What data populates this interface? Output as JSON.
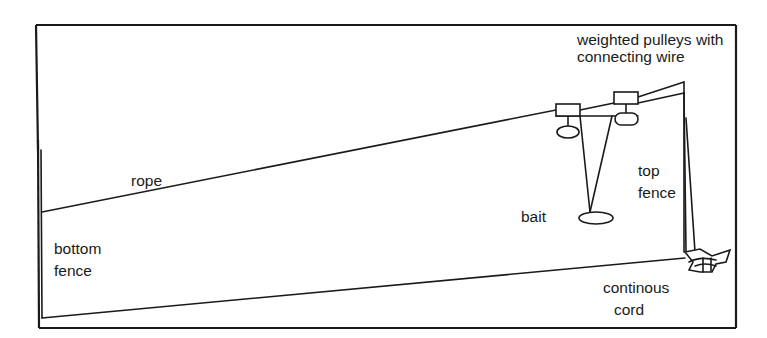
{
  "diagram": {
    "type": "schematic",
    "labels": {
      "pulleys": [
        "weighted pulleys with",
        "connecting wire"
      ],
      "rope": "rope",
      "bait": "bait",
      "top_fence": [
        "top",
        "fence"
      ],
      "bottom_fence": [
        "bottom",
        "fence"
      ],
      "cord": [
        "continous",
        "cord"
      ]
    },
    "colors": {
      "ink": "#1a1a1a",
      "background": "#ffffff"
    }
  }
}
